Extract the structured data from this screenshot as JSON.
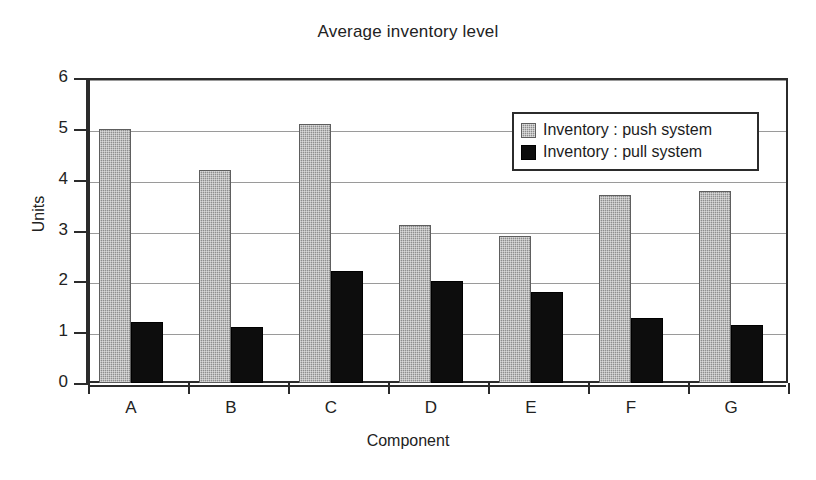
{
  "chart_data": {
    "type": "bar",
    "title": "Average inventory level",
    "xlabel": "Component",
    "ylabel": "Units",
    "categories": [
      "A",
      "B",
      "C",
      "D",
      "E",
      "F",
      "G"
    ],
    "series": [
      {
        "name": "Inventory : push system",
        "key": "push",
        "color": "#8e8e8e",
        "values": [
          5.0,
          4.2,
          5.1,
          3.1,
          2.9,
          3.7,
          3.78
        ]
      },
      {
        "name": "Inventory : pull system",
        "key": "pull",
        "color": "#0d0d0d",
        "values": [
          1.2,
          1.1,
          2.2,
          2.0,
          1.8,
          1.28,
          1.15
        ]
      }
    ],
    "ylim": [
      0,
      6
    ],
    "yticks": [
      0,
      1,
      2,
      3,
      4,
      5,
      6
    ],
    "ytick_labels": [
      "0",
      "1",
      "2",
      "3",
      "4",
      "5",
      "6"
    ],
    "grid": true,
    "grid_axis": "y",
    "legend_position": "upper right inside plot area"
  }
}
